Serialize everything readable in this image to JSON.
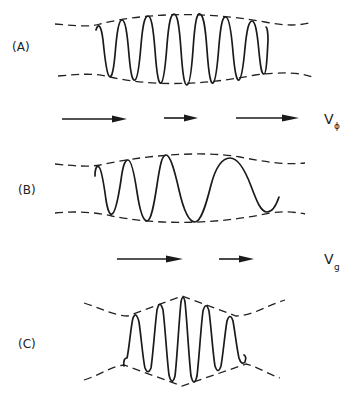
{
  "figure": {
    "panels": [
      {
        "id": "A",
        "label": "(A)",
        "description": "Wave packet with uniform carrier inside a smooth envelope"
      },
      {
        "id": "B",
        "label": "(B)",
        "description": "Dispersing wave packet — wavelength increases to the right"
      },
      {
        "id": "C",
        "label": "(C)",
        "description": "Compressed wave packet with peaked envelope"
      }
    ],
    "velocity_rows": [
      {
        "id": "phase",
        "label": "V",
        "subscript": "ϕ",
        "arrow_count": 3
      },
      {
        "id": "group",
        "label": "V",
        "subscript": "g",
        "arrow_count": 2
      }
    ],
    "colors": {
      "ink": "#1a1a1a",
      "background": "#ffffff"
    }
  }
}
